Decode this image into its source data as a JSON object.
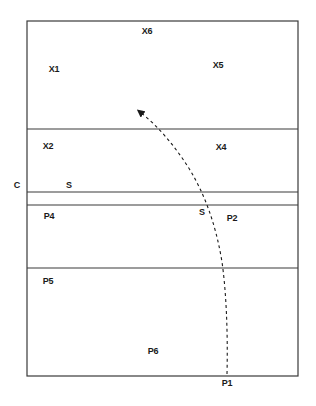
{
  "diagram": {
    "type": "volleyball-court-play",
    "colors": {
      "line": "#3a3a3a",
      "text": "#1a1a1a",
      "background": "#ffffff"
    },
    "court": {
      "left": 27,
      "top": 21,
      "right": 298,
      "bottom": 376,
      "dividers_y": [
        129,
        192,
        205,
        268
      ]
    },
    "labels": [
      {
        "id": "x6",
        "text": "X6",
        "x": 147,
        "y": 31
      },
      {
        "id": "x1",
        "text": "X1",
        "x": 54,
        "y": 69
      },
      {
        "id": "x5",
        "text": "X5",
        "x": 218,
        "y": 65
      },
      {
        "id": "x2",
        "text": "X2",
        "x": 48,
        "y": 146
      },
      {
        "id": "x4",
        "text": "X4",
        "x": 221,
        "y": 147
      },
      {
        "id": "c",
        "text": "C",
        "x": 17,
        "y": 185
      },
      {
        "id": "s-left",
        "text": "S",
        "x": 69,
        "y": 185
      },
      {
        "id": "s-right",
        "text": "S",
        "x": 202,
        "y": 212
      },
      {
        "id": "p4",
        "text": "P4",
        "x": 49,
        "y": 216
      },
      {
        "id": "p2",
        "text": "P2",
        "x": 232,
        "y": 218
      },
      {
        "id": "p5",
        "text": "P5",
        "x": 48,
        "y": 281
      },
      {
        "id": "p6",
        "text": "P6",
        "x": 153,
        "y": 351
      },
      {
        "id": "p1",
        "text": "P1",
        "x": 227,
        "y": 383
      }
    ],
    "path": {
      "style": "dashed",
      "description": "Serve trajectory from P1 curving over the net toward the opponent back court",
      "from": "P1",
      "points": [
        [
          227,
          374
        ],
        [
          226,
          320
        ],
        [
          225,
          268
        ],
        [
          210,
          205
        ],
        [
          203,
          192
        ],
        [
          162,
          129
        ],
        [
          138,
          110
        ]
      ],
      "arrow": "end"
    }
  }
}
